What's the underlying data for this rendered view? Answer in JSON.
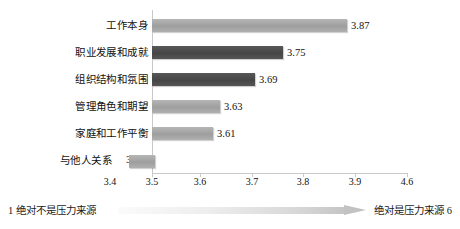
{
  "chart_data": {
    "type": "bar",
    "orientation": "horizontal",
    "title": "",
    "xlabel": "",
    "ylabel": "",
    "categories": [
      "工作本身",
      "职业发展和成就",
      "组织结构和氛围",
      "管理角色和期望",
      "家庭和工作平衡",
      "与他人关系"
    ],
    "values": [
      3.87,
      3.75,
      3.69,
      3.63,
      3.61,
      3.45
    ],
    "value_labels": [
      "3.87",
      "3.75",
      "3.69",
      "3.63",
      "3.61",
      "3.45"
    ],
    "xticks": [
      3.4,
      3.5,
      3.6,
      3.7,
      3.8,
      3.9,
      4.6
    ],
    "xtick_labels": [
      "3.4",
      "3.5",
      "3.6",
      "3.7",
      "3.8",
      "3.9",
      "4.6"
    ],
    "xlim": [
      3.4,
      4.0
    ],
    "grid": false,
    "legend": false,
    "bar_colors": [
      "#a8a8a8",
      "#4d4d4d",
      "#4d4d4d",
      "#a8a8a8",
      "#a8a8a8",
      "#a8a8a8"
    ]
  },
  "axis": {
    "ticks": [
      {
        "label": "3.4",
        "x": 110
      },
      {
        "label": "3.5",
        "x": 152
      },
      {
        "label": "3.6",
        "x": 200
      },
      {
        "label": "3.7",
        "x": 252
      },
      {
        "label": "3.8",
        "x": 303
      },
      {
        "label": "3.9",
        "x": 355
      },
      {
        "label": "4.6",
        "x": 407
      }
    ]
  },
  "footer": {
    "left_text": "1 绝对不是压力来源",
    "right_text": "绝对是压力来源 6",
    "arrow_name": "gradient-arrow-right"
  },
  "bars": [
    {
      "label": "工作本身",
      "value_label": "3.87",
      "width": 195,
      "tone": "light"
    },
    {
      "label": "职业发展和成就",
      "value_label": "3.75",
      "width": 131,
      "tone": "dark"
    },
    {
      "label": "组织结构和氛围",
      "value_label": "3.69",
      "width": 103,
      "tone": "dark"
    },
    {
      "label": "管理角色和期望",
      "value_label": "3.63",
      "width": 68,
      "tone": "light"
    },
    {
      "label": "家庭和工作平衡",
      "value_label": "3.61",
      "width": 61,
      "tone": "light"
    },
    {
      "label": "与他人关系",
      "value_label": "3.45",
      "width": 26,
      "tone": "light"
    }
  ]
}
